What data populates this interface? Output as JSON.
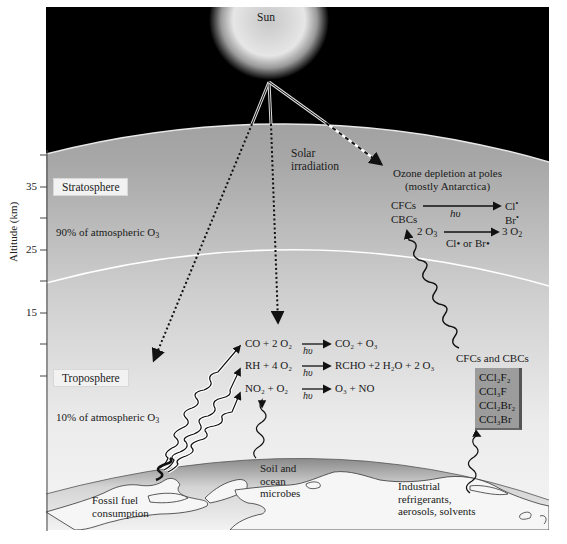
{
  "diagram": {
    "sun_label": "Sun",
    "solar_irradiation_label": [
      "Solar",
      "irradiation"
    ],
    "axis": {
      "label": "Altitude (km)",
      "ticks": [
        "35",
        "25",
        "15"
      ]
    },
    "layers": {
      "stratosphere": {
        "label": "Stratosphere",
        "ozone_share": "90% of atmospheric O",
        "ozone_sub": "3"
      },
      "troposphere": {
        "label": "Troposphere",
        "ozone_share": "10% of atmospheric O",
        "ozone_sub": "3"
      }
    },
    "ozone_depletion": {
      "title_line1": "Ozone depletion at poles",
      "title_line2": "(mostly Antarctica)",
      "reactant1": "CFCs",
      "reactant2": "CBCs",
      "catalyst": "hυ",
      "product1": "Cl",
      "product2": "Br",
      "radical": "•",
      "reaction2_left": "2 O",
      "reaction2_left_sub": "3",
      "reaction2_catalyst": "Cl• or Br•",
      "reaction2_right": "3 O",
      "reaction2_right_sub": "2"
    },
    "tropo_reactions": [
      {
        "left": "CO + 2 O₂",
        "catalyst": "hυ",
        "right": "CO₂ + O₃"
      },
      {
        "left": "RH + 4 O₂",
        "catalyst": "hυ",
        "right": "RCHO +2 H₂O + 2 O₃"
      },
      {
        "left": "NO₂ + O₂",
        "catalyst": "hυ",
        "right": "O₃ + NO"
      }
    ],
    "cfc_section": {
      "title": "CFCs and CBCs",
      "compounds": [
        "CCl₂F₂",
        "CCl₃F",
        "CCl₂Br₂",
        "CCl₃Br"
      ]
    },
    "sources": {
      "fossil_fuel": [
        "Fossil fuel",
        "consumption"
      ],
      "soil": [
        "Soil and",
        "ocean",
        "microbes"
      ],
      "industrial": [
        "Industrial",
        "refrigerants,",
        "aerosols, solvents"
      ]
    },
    "colors": {
      "space": "#000000",
      "stratosphere_top": "#9a9a9a",
      "troposphere_bottom": "#f0f0f0",
      "earth_shade": "#8f8f8f",
      "earth_light": "#f4f4f4",
      "cfc_box": "#9c9c9c"
    }
  }
}
